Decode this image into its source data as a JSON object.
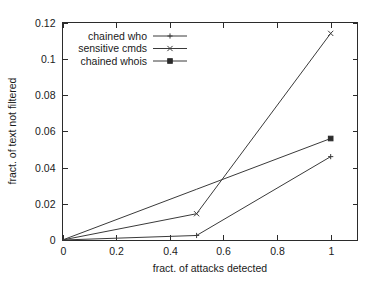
{
  "chart_data": {
    "type": "line",
    "title": "",
    "xlabel": "fract. of attacks detected",
    "ylabel": "fract. of text not filtered",
    "xlim": [
      0,
      1.1
    ],
    "ylim": [
      0,
      0.12
    ],
    "grid": false,
    "legend_position": "top-left-inside",
    "xticks": [
      "0",
      "0.2",
      "0.4",
      "0.6",
      "0.8",
      "1"
    ],
    "xtick_values": [
      0,
      0.2,
      0.4,
      0.6,
      0.8,
      1
    ],
    "yticks": [
      "0",
      "0.02",
      "0.04",
      "0.06",
      "0.08",
      "0.1",
      "0.12"
    ],
    "ytick_values": [
      0,
      0.02,
      0.04,
      0.06,
      0.08,
      0.1,
      0.12
    ],
    "x": [
      0,
      0.5,
      1
    ],
    "series": [
      {
        "name": "chained who",
        "marker": "plus",
        "values": [
          0,
          0.0025,
          0.046
        ]
      },
      {
        "name": "sensitive cmds",
        "marker": "cross",
        "values": [
          0,
          0.0145,
          0.114
        ]
      },
      {
        "name": "chained whois",
        "marker": "filled-square",
        "values": [
          0,
          0.028,
          0.056
        ]
      }
    ]
  },
  "legend": {
    "entries": [
      {
        "label": "chained who"
      },
      {
        "label": "sensitive cmds"
      },
      {
        "label": "chained whois"
      }
    ]
  }
}
